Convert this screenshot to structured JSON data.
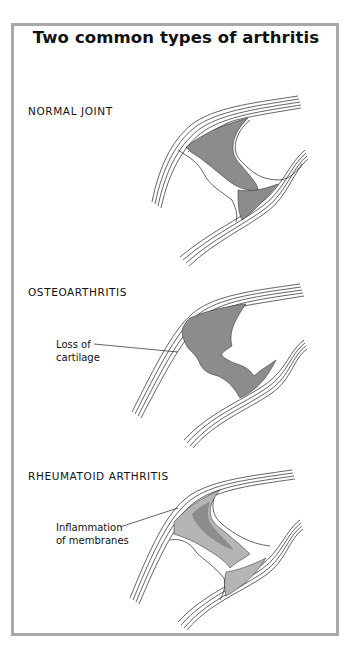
{
  "figure": {
    "title": "Two common types of arthritis",
    "border_color": "#a8a8a8",
    "shading_color": "#8c8c8c",
    "sections": [
      {
        "label": "NORMAL JOINT",
        "callout": null
      },
      {
        "label": "OSTEOARTHRITIS",
        "callout": {
          "line1": "Loss of",
          "line2": "cartilage"
        }
      },
      {
        "label": "RHEUMATOID ARTHRITIS",
        "callout": {
          "line1": "Inflammation",
          "line2": "of membranes"
        }
      }
    ]
  }
}
